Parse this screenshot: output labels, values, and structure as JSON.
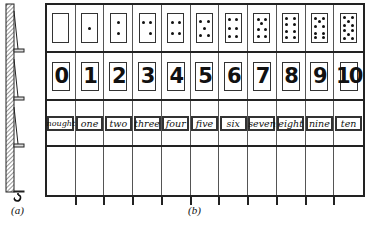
{
  "figure": {
    "panel_a_label": "(a)",
    "panel_b_label": "(b)"
  },
  "board": {
    "dot_cards": [
      {
        "value": 0,
        "dots": []
      },
      {
        "value": 1,
        "dots": [
          [
            50,
            50
          ]
        ]
      },
      {
        "value": 2,
        "dots": [
          [
            50,
            30
          ],
          [
            50,
            70
          ]
        ]
      },
      {
        "value": 3,
        "dots": [
          [
            25,
            30
          ],
          [
            75,
            30
          ],
          [
            75,
            70
          ]
        ]
      },
      {
        "value": 4,
        "dots": [
          [
            25,
            30
          ],
          [
            75,
            30
          ],
          [
            25,
            70
          ],
          [
            75,
            70
          ]
        ]
      },
      {
        "value": 5,
        "dots": [
          [
            25,
            25
          ],
          [
            75,
            25
          ],
          [
            50,
            50
          ],
          [
            25,
            75
          ],
          [
            75,
            75
          ]
        ]
      },
      {
        "value": 6,
        "dots": [
          [
            25,
            20
          ],
          [
            75,
            20
          ],
          [
            25,
            50
          ],
          [
            75,
            50
          ],
          [
            25,
            80
          ],
          [
            75,
            80
          ]
        ]
      },
      {
        "value": 7,
        "dots": [
          [
            25,
            18
          ],
          [
            75,
            18
          ],
          [
            50,
            35
          ],
          [
            25,
            55
          ],
          [
            75,
            55
          ],
          [
            25,
            82
          ],
          [
            75,
            82
          ]
        ]
      },
      {
        "value": 8,
        "dots": [
          [
            25,
            15
          ],
          [
            75,
            15
          ],
          [
            25,
            38
          ],
          [
            75,
            38
          ],
          [
            25,
            62
          ],
          [
            75,
            62
          ],
          [
            25,
            85
          ],
          [
            75,
            85
          ]
        ]
      },
      {
        "value": 9,
        "dots": [
          [
            25,
            15
          ],
          [
            75,
            15
          ],
          [
            50,
            28
          ],
          [
            25,
            45
          ],
          [
            75,
            45
          ],
          [
            25,
            68
          ],
          [
            75,
            68
          ],
          [
            25,
            85
          ],
          [
            75,
            85
          ]
        ]
      },
      {
        "value": 10,
        "dots": [
          [
            25,
            13
          ],
          [
            75,
            13
          ],
          [
            50,
            26
          ],
          [
            25,
            40
          ],
          [
            75,
            40
          ],
          [
            25,
            60
          ],
          [
            75,
            60
          ],
          [
            50,
            74
          ],
          [
            25,
            87
          ],
          [
            75,
            87
          ]
        ]
      }
    ],
    "numerals": [
      "0",
      "1",
      "2",
      "3",
      "4",
      "5",
      "6",
      "7",
      "8",
      "9",
      "10"
    ],
    "words": [
      "nought",
      "one",
      "two",
      "three",
      "four",
      "five",
      "six",
      "seven",
      "eight",
      "nine",
      "ten"
    ]
  }
}
